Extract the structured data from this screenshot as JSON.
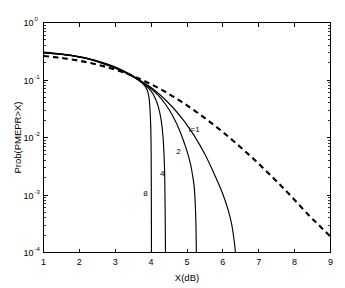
{
  "chart_data": {
    "type": "line",
    "title": "",
    "xlabel": "X(dB)",
    "ylabel": "Prob(PMEPR>X)",
    "xlim": [
      1,
      9
    ],
    "ylim": [
      0.0001,
      1
    ],
    "yscale": "log",
    "xscale": "linear",
    "grid": false,
    "legend_position": "inline-annotations",
    "xticks": [
      "1",
      "2",
      "3",
      "4",
      "5",
      "6",
      "7",
      "8",
      "9"
    ],
    "xtick_values": [
      1,
      2,
      3,
      4,
      5,
      6,
      7,
      8,
      9
    ],
    "yticks": [
      "10^0",
      "10^-1",
      "10^-2",
      "10^-3",
      "10^-4"
    ],
    "ytick_values": [
      1,
      0.1,
      0.01,
      0.001,
      0.0001
    ],
    "ytick_mantissa": "10",
    "ytick_exponents": [
      "0",
      "-1",
      "-2",
      "-3",
      "-4"
    ],
    "annotations": [
      {
        "text": "i=1",
        "x": 5.05,
        "y": 0.0125
      },
      {
        "text": "2",
        "x": 4.7,
        "y": 0.0052
      },
      {
        "text": "4",
        "x": 4.25,
        "y": 0.0021
      },
      {
        "text": "8",
        "x": 3.78,
        "y": 0.00097
      }
    ],
    "series": [
      {
        "name": "reference",
        "style": "dashed",
        "label": "",
        "points": [
          [
            1.0,
            0.262
          ],
          [
            1.3,
            0.25
          ],
          [
            1.6,
            0.237
          ],
          [
            2.0,
            0.216
          ],
          [
            2.4,
            0.192
          ],
          [
            2.8,
            0.165
          ],
          [
            3.2,
            0.138
          ],
          [
            3.6,
            0.11
          ],
          [
            4.0,
            0.0845
          ],
          [
            4.4,
            0.062
          ],
          [
            4.8,
            0.0437
          ],
          [
            5.2,
            0.0297
          ],
          [
            5.6,
            0.0195
          ],
          [
            6.0,
            0.0124
          ],
          [
            6.4,
            0.00762
          ],
          [
            6.8,
            0.00455
          ],
          [
            7.2,
            0.00264
          ],
          [
            7.6,
            0.00149
          ],
          [
            8.0,
            0.00082
          ],
          [
            8.4,
            0.00044
          ],
          [
            8.7,
            0.00029
          ],
          [
            9.0,
            0.000188
          ]
        ]
      },
      {
        "name": "i=1",
        "style": "solid",
        "label": "i=1",
        "points": [
          [
            1.0,
            0.305
          ],
          [
            1.4,
            0.288
          ],
          [
            1.8,
            0.266
          ],
          [
            2.2,
            0.236
          ],
          [
            2.6,
            0.2
          ],
          [
            3.0,
            0.163
          ],
          [
            3.4,
            0.125
          ],
          [
            3.7,
            0.0985
          ],
          [
            4.0,
            0.074
          ],
          [
            4.3,
            0.0517
          ],
          [
            4.6,
            0.0336
          ],
          [
            4.9,
            0.02
          ],
          [
            5.2,
            0.0108
          ],
          [
            5.5,
            0.0051
          ],
          [
            5.8,
            0.00203
          ],
          [
            6.0,
            0.00103
          ],
          [
            6.15,
            0.00054
          ],
          [
            6.25,
            0.0003
          ],
          [
            6.32,
            0.00015
          ],
          [
            6.35,
            0.0001
          ]
        ]
      },
      {
        "name": "2",
        "style": "solid",
        "label": "2",
        "points": [
          [
            1.0,
            0.3
          ],
          [
            1.5,
            0.282
          ],
          [
            2.0,
            0.252
          ],
          [
            2.5,
            0.209
          ],
          [
            3.0,
            0.16
          ],
          [
            3.4,
            0.122
          ],
          [
            3.7,
            0.0953
          ],
          [
            4.0,
            0.0705
          ],
          [
            4.2,
            0.0538
          ],
          [
            4.4,
            0.0378
          ],
          [
            4.6,
            0.0238
          ],
          [
            4.8,
            0.013
          ],
          [
            5.0,
            0.0058
          ],
          [
            5.1,
            0.0034
          ],
          [
            5.15,
            0.0023
          ],
          [
            5.2,
            0.0014
          ],
          [
            5.23,
            0.0007
          ],
          [
            5.25,
            0.0003
          ],
          [
            5.26,
            0.0001
          ]
        ]
      },
      {
        "name": "4",
        "style": "solid",
        "label": "4",
        "points": [
          [
            1.0,
            0.298
          ],
          [
            1.6,
            0.276
          ],
          [
            2.2,
            0.24
          ],
          [
            2.8,
            0.188
          ],
          [
            3.2,
            0.148
          ],
          [
            3.5,
            0.117
          ],
          [
            3.8,
            0.086
          ],
          [
            4.0,
            0.064
          ],
          [
            4.1,
            0.05
          ],
          [
            4.2,
            0.0345
          ],
          [
            4.28,
            0.02
          ],
          [
            4.33,
            0.0105
          ],
          [
            4.36,
            0.005
          ],
          [
            4.38,
            0.002
          ],
          [
            4.39,
            0.0006
          ],
          [
            4.4,
            0.0001
          ]
        ]
      },
      {
        "name": "8",
        "style": "solid",
        "label": "8",
        "points": [
          [
            1.0,
            0.296
          ],
          [
            1.6,
            0.274
          ],
          [
            2.2,
            0.238
          ],
          [
            2.8,
            0.186
          ],
          [
            3.2,
            0.146
          ],
          [
            3.5,
            0.115
          ],
          [
            3.75,
            0.088
          ],
          [
            3.88,
            0.07
          ],
          [
            3.94,
            0.05
          ],
          [
            3.97,
            0.03
          ],
          [
            3.99,
            0.015
          ],
          [
            4.0,
            0.006
          ],
          [
            4.005,
            0.0015
          ],
          [
            4.01,
            0.0001
          ]
        ]
      }
    ]
  }
}
